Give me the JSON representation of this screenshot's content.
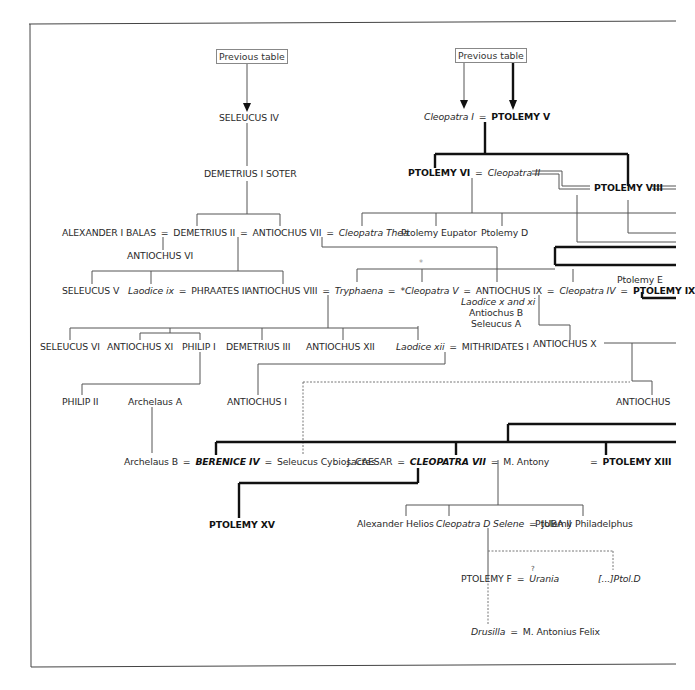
{
  "header": {
    "prev_table_left": "Previous table",
    "prev_table_right": "Previous table"
  },
  "seleucid": {
    "seleucus_iv": "SELEUCUS IV",
    "demetrius_i": "DEMETRIUS I SOTER",
    "alexander_i_balas": "ALEXANDER I BALAS",
    "demetrius_ii": "DEMETRIUS II",
    "antiochus_vii": "ANTIOCHUS VII",
    "cleopatra_thea": "Cleopatra Thea",
    "antiochus_vi": "ANTIOCHUS VI",
    "seleucus_v": "SELEUCUS V",
    "laodice_ix": "Laodice ix",
    "phraates_ii": "PHRAATES II",
    "antiochus_viii": "ANTIOCHUS VIII",
    "tryphaena": "Tryphaena",
    "cleopatra_v": "*Cleopatra V",
    "antiochus_ix": "ANTIOCHUS IX",
    "laodice_x_xi": "Laodice x and xi",
    "antiochus_b": "Antiochus B",
    "seleucus_a": "Seleucus A",
    "seleucus_vi": "SELEUCUS VI",
    "antiochus_xi": "ANTIOCHUS XI",
    "philip_i": "PHILIP I",
    "demetrius_iii": "DEMETRIUS III",
    "antiochus_xii": "ANTIOCHUS XII",
    "laodice_xii": "Laodice xii",
    "mithridates_i": "MITHRIDATES I",
    "antiochus_x": "ANTIOCHUS X",
    "philip_ii": "PHILIP II",
    "archelaus_a": "Archelaus A",
    "antiochus_i": "ANTIOCHUS I",
    "antiochus_xiii": "ANTIOCHUS",
    "archelaus_b": "Archelaus B",
    "seleucus_cybiosactes": "Seleucus Cybiosactes"
  },
  "ptolemaic": {
    "cleopatra_i": "Cleopatra I",
    "ptolemy_v": "PTOLEMY V",
    "ptolemy_vi": "PTOLEMY VI",
    "cleopatra_ii": "Cleopatra II",
    "ptolemy_viii": "PTOLEMY VIII",
    "ptolemy_eupator": "Ptolemy Eupator",
    "ptolemy_d": "Ptolemy D",
    "cleopatra_iv": "Cleopatra IV",
    "ptolemy_e": "Ptolemy E",
    "ptolemy_ix": "PTOLEMY IX",
    "berenice_iv": "BERENICE IV",
    "j_caesar": "J. CAESAR",
    "cleopatra_vii": "CLEOPATRA VII",
    "m_antony": "M. Antony",
    "ptolemy_xiii": "PTOLEMY XIII",
    "ptolemy_xv": "PTOLEMY XV",
    "alexander_helios": "Alexander Helios",
    "cleopatra_selene": "Cleopatra D Selene",
    "juba_ii": "JUBA II",
    "ptolemy_philadelphus": "Ptolemy Philadelphus",
    "ptolemy_f": "PTOLEMY F",
    "uncertain_mark": "?",
    "urania": "Urania",
    "ptol_d_fragment": "[...]Ptol.D",
    "drusilla": "Drusilla",
    "m_antonius_felix": "M. Antonius Felix"
  },
  "symbols": {
    "marriage": "=",
    "star": "*"
  }
}
